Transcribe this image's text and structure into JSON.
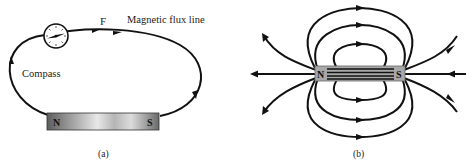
{
  "figure_a": {
    "caption": "(a)",
    "labels": {
      "force": "F",
      "flux_line": "Magnetic flux line",
      "compass": "Compass"
    },
    "magnet": {
      "north": "N",
      "south": "S"
    }
  },
  "figure_b": {
    "caption": "(b)",
    "magnet": {
      "north": "N",
      "south": "S"
    }
  },
  "colors": {
    "line": "#111111",
    "magnet_fill_light": "#e6e6e6",
    "magnet_fill_dark": "#7a7a7a",
    "magnet_b_fill": "#a8a8a8"
  }
}
